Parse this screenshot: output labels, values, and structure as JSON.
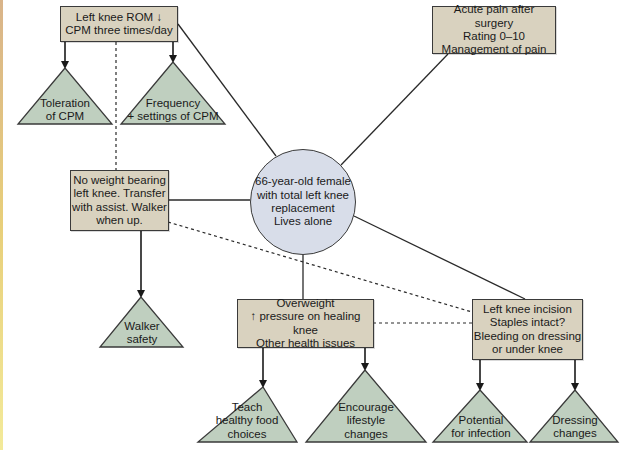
{
  "colors": {
    "box_fill": "#d9d2bf",
    "circle_fill": "#d8dde9",
    "triangle_fill": "#bfcfbf",
    "stroke": "#3a3a3a"
  },
  "center": {
    "lines": [
      "66-year-old female",
      "with total left knee",
      "replacement",
      "Lives alone"
    ]
  },
  "problems": {
    "rom": {
      "lines": [
        "Left knee ROM ↓",
        "CPM three times/day"
      ]
    },
    "pain": {
      "lines": [
        "Acute pain after surgery",
        "Rating 0–10",
        "Management of pain"
      ]
    },
    "mobility": {
      "lines": [
        "No weight bearing",
        "left knee.  Transfer",
        "with assist.  Walker",
        "when up."
      ]
    },
    "weight": {
      "lines": [
        "Overweight",
        "↑ pressure on healing knee",
        "Other health issues"
      ]
    },
    "incision": {
      "lines": [
        "Left knee incision",
        "Staples intact?",
        "Bleeding on dressing",
        "or under knee"
      ]
    }
  },
  "interventions": {
    "toleration": {
      "lines": [
        "Toleration",
        "of CPM"
      ]
    },
    "frequency": {
      "lines": [
        "Frequency",
        "+ settings of CPM"
      ]
    },
    "walker": {
      "lines": [
        "Walker",
        "safety"
      ]
    },
    "teach": {
      "lines": [
        "Teach",
        "healthy food",
        "choices"
      ]
    },
    "encourage": {
      "lines": [
        "Encourage",
        "lifestyle",
        "changes"
      ]
    },
    "potential": {
      "lines": [
        "Potential",
        "for infection"
      ]
    },
    "dressing": {
      "lines": [
        "Dressing",
        "changes"
      ]
    }
  }
}
